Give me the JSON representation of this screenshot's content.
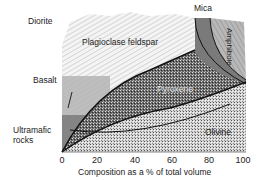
{
  "figure": {
    "type": "igneous-rock-mineral-composition-diagram",
    "rock_labels": {
      "diorite": "Diorite",
      "basalt": "Basalt",
      "ultramafic_line1": "Ultramafic",
      "ultramafic_line2": "rocks"
    },
    "mineral_labels": {
      "plagioclase": "Plagioclase feldspar",
      "mica": "Mica",
      "amphibole": "Amphibole",
      "pyroxene": "Pyroxene",
      "olivine": "Olivine"
    },
    "x_axis": {
      "ticks": [
        "0",
        "20",
        "40",
        "60",
        "80",
        "100"
      ],
      "title": "Composition as a % of total volume"
    },
    "colors": {
      "plagioclase_fill": "#e8e8e8",
      "basalt_band": "#b4b4b4",
      "ultramafic_band": "#8a8a8a",
      "pyroxene_fill": "#6e6e6e",
      "olivine_fill": "#c8c8c8",
      "mica_fill": "#7a7a7a",
      "amphibole_fill": "#a9a9a9",
      "boundary_line": "#111111"
    }
  }
}
